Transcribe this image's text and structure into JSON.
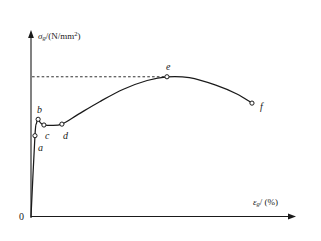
{
  "figure": {
    "title": "",
    "background_color": "#ffffff",
    "line_color": "#1a1a1a",
    "width": 321,
    "height": 241
  },
  "axes": {
    "origin_label": "0",
    "y_axis": {
      "name": "stress-axis",
      "label_var": "σ",
      "label_sub": "g",
      "label_unit": "/(N/mm",
      "label_sup": "2",
      "label_close": ")",
      "label_full": "σg/(N/mm2)"
    },
    "x_axis": {
      "name": "strain-axis",
      "label_var": "ε",
      "label_sub": "g",
      "label_unit": "/ (%)",
      "label_full": "εg/(%)"
    }
  },
  "chart_data": {
    "type": "line",
    "title": "",
    "xlabel": "εg/(%)",
    "ylabel": "σg/(N/mm2)",
    "xlim": [
      0,
      100
    ],
    "ylim": [
      0,
      100
    ],
    "grid": false,
    "legend": null,
    "annotations": [
      {
        "label": "ultimate-strength-dashed-line",
        "type": "dashed-horizontal",
        "from_x": 0.4,
        "to_x": 51.5,
        "y": 78.5
      }
    ],
    "markers": [
      {
        "label": "a",
        "x": 1.5,
        "y": 45.4,
        "label_dx": 3,
        "label_dy": 12
      },
      {
        "label": "b",
        "x": 2.7,
        "y": 54.6,
        "label_dx": -1,
        "label_dy": -9
      },
      {
        "label": "c",
        "x": 4.9,
        "y": 51.4,
        "label_dx": 1,
        "label_dy": 11
      },
      {
        "label": "d",
        "x": 11.7,
        "y": 51.9,
        "label_dx": 1,
        "label_dy": 12
      },
      {
        "label": "e",
        "x": 51.5,
        "y": 78.5,
        "label_dx": -1,
        "label_dy": -10
      },
      {
        "label": "f",
        "x": 83.7,
        "y": 63.7,
        "label_dx": 8,
        "label_dy": 4
      }
    ],
    "curve_points": [
      {
        "x": 0.0,
        "y": 0.0
      },
      {
        "x": 1.5,
        "y": 45.4
      },
      {
        "x": 2.1,
        "y": 52.5
      },
      {
        "x": 2.7,
        "y": 54.6
      },
      {
        "x": 3.6,
        "y": 52.6
      },
      {
        "x": 4.9,
        "y": 51.4
      },
      {
        "x": 7.0,
        "y": 51.2
      },
      {
        "x": 11.7,
        "y": 51.9
      },
      {
        "x": 18.0,
        "y": 57.5
      },
      {
        "x": 26.0,
        "y": 64.5
      },
      {
        "x": 35.0,
        "y": 71.5
      },
      {
        "x": 44.0,
        "y": 76.4
      },
      {
        "x": 51.5,
        "y": 78.5
      },
      {
        "x": 60.0,
        "y": 78.0
      },
      {
        "x": 70.0,
        "y": 73.8
      },
      {
        "x": 78.0,
        "y": 68.8
      },
      {
        "x": 83.7,
        "y": 63.7
      }
    ]
  }
}
